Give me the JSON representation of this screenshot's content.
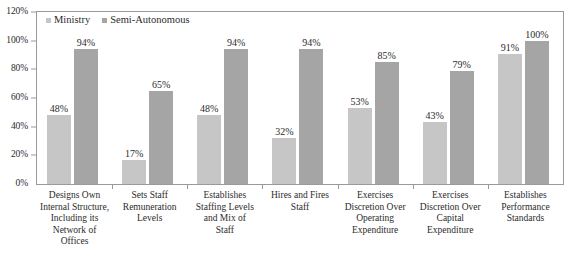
{
  "chart_data": {
    "type": "bar",
    "title": "",
    "subtitle": "",
    "xlabel": "",
    "ylabel": "",
    "ylim": [
      0,
      120
    ],
    "y_unit": "%",
    "grid": false,
    "legend_position": "top-left",
    "y_ticks": [
      "0%",
      "20%",
      "40%",
      "60%",
      "80%",
      "100%",
      "120%"
    ],
    "y_tick_values": [
      0,
      20,
      40,
      60,
      80,
      100,
      120
    ],
    "categories": [
      "Designs Own Internal Structure, Including its Network of Offices",
      "Sets Staff Remuneration Levels",
      "Establishes Staffing Levels and Mix of Staff",
      "Hires and Fires Staff",
      "Exercises Discretion Over Operating Expenditure",
      "Exercises Discretion Over Capital Expenditure",
      "Establishes Performance Standards"
    ],
    "category_lines": [
      [
        "Designs Own",
        "Internal Structure,",
        "Including its",
        "Network of",
        "Offices"
      ],
      [
        "Sets Staff",
        "Remuneration",
        "Levels"
      ],
      [
        "Establishes",
        "Staffing Levels",
        "and Mix of",
        "Staff"
      ],
      [
        "Hires and Fires",
        "Staff"
      ],
      [
        "Exercises",
        "Discretion Over",
        "Operating",
        "Expenditure"
      ],
      [
        "Exercises",
        "Discretion Over",
        "Capital",
        "Expenditure"
      ],
      [
        "Establishes",
        "Performance",
        "Standards"
      ]
    ],
    "series": [
      {
        "name": "Ministry",
        "color": "#c6c6c6",
        "values": [
          48,
          17,
          48,
          32,
          53,
          43,
          91
        ],
        "labels": [
          "48%",
          "17%",
          "48%",
          "32%",
          "53%",
          "43%",
          "91%"
        ]
      },
      {
        "name": "Semi-Autonomous",
        "color": "#a5a5a5",
        "values": [
          94,
          65,
          94,
          94,
          85,
          79,
          100
        ],
        "labels": [
          "94%",
          "65%",
          "94%",
          "94%",
          "85%",
          "79%",
          "100%"
        ]
      }
    ]
  },
  "legend": {
    "items": [
      {
        "label": "Ministry",
        "color": "#c6c6c6"
      },
      {
        "label": "Semi-Autonomous",
        "color": "#a5a5a5"
      }
    ]
  },
  "colors": {
    "ministry": "#c6c6c6",
    "semi_autonomous": "#a5a5a5",
    "axis": "#9a9a9a",
    "text": "#2b2b2b",
    "background": "#ffffff"
  }
}
